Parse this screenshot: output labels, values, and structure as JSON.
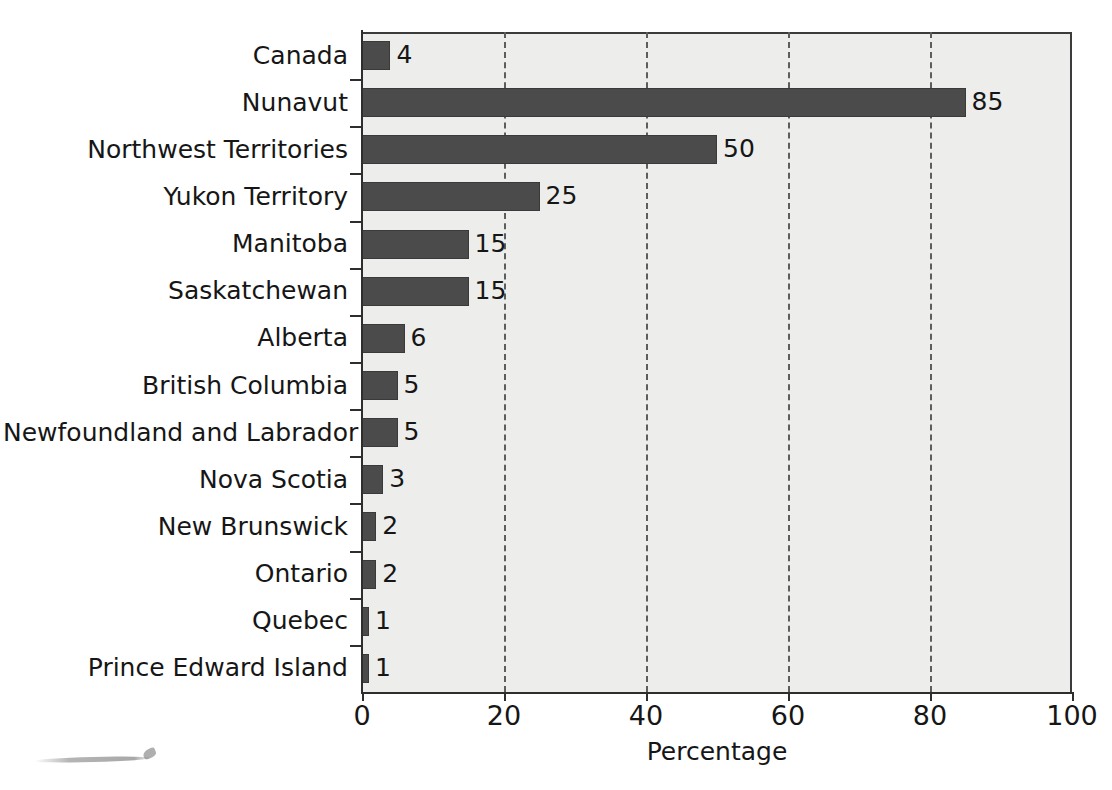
{
  "chart_data": {
    "type": "bar",
    "orientation": "horizontal",
    "title": "",
    "subtitle": "",
    "xlabel": "Percentage",
    "ylabel": "",
    "xlim": [
      0,
      100
    ],
    "xticks": [
      "0",
      "20",
      "40",
      "60",
      "80",
      "100"
    ],
    "grid": "vertical-dashed",
    "legend": "none",
    "categories": [
      "Canada",
      "Nunavut",
      "Northwest Territories",
      "Yukon Territory",
      "Manitoba",
      "Saskatchewan",
      "Alberta",
      "British Columbia",
      "Newfoundland and Labrador",
      "Nova Scotia",
      "New Brunswick",
      "Ontario",
      "Quebec",
      "Prince Edward Island"
    ],
    "values": [
      4,
      85,
      50,
      25,
      15,
      15,
      6,
      5,
      5,
      3,
      2,
      2,
      1,
      1
    ],
    "value_labels": [
      "4",
      "85",
      "50",
      "25",
      "15",
      "15",
      "6",
      "5",
      "5",
      "3",
      "2",
      "2",
      "1",
      "1"
    ],
    "colors": {
      "bar_fill": "#4b4b4b",
      "bar_edge": "#3a3a3a",
      "plot_background": "#ededeb",
      "page_background": "#ffffff",
      "axis": "#2e2e2e",
      "gridline": "#5d5d5d",
      "text": "#161616"
    }
  }
}
